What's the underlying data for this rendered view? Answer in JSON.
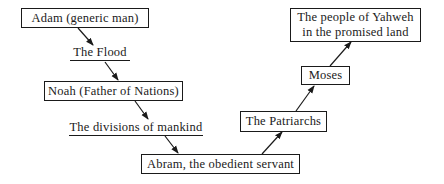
{
  "diagram": {
    "type": "flow",
    "nodes": [
      {
        "id": "adam",
        "label": "Adam (generic man)",
        "style": "box"
      },
      {
        "id": "flood",
        "label": "The Flood",
        "style": "underlined"
      },
      {
        "id": "noah",
        "label": "Noah (Father of Nations)",
        "style": "box"
      },
      {
        "id": "divisions",
        "label": "The divisions of mankind",
        "style": "underlined"
      },
      {
        "id": "abram",
        "label": "Abram, the obedient servant",
        "style": "box"
      },
      {
        "id": "patriarchs",
        "label": "The Patriarchs",
        "style": "box"
      },
      {
        "id": "moses",
        "label": "Moses",
        "style": "box"
      },
      {
        "id": "yahweh",
        "label_line1": "The people of Yahweh",
        "label_line2": "in the promised land",
        "style": "box"
      }
    ],
    "edges": [
      {
        "from": "adam",
        "to": "flood"
      },
      {
        "from": "flood",
        "to": "noah"
      },
      {
        "from": "noah",
        "to": "divisions"
      },
      {
        "from": "divisions",
        "to": "abram"
      },
      {
        "from": "abram",
        "to": "patriarchs"
      },
      {
        "from": "patriarchs",
        "to": "moses"
      },
      {
        "from": "moses",
        "to": "yahweh"
      }
    ]
  }
}
